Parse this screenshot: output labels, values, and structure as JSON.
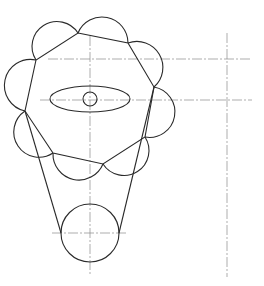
{
  "drawing": {
    "type": "technical-line-drawing",
    "colors": {
      "outline": "#2a2a2a",
      "centerline": "#8a8a8a",
      "background": "#ffffff"
    },
    "polygon_vertices": [
      [
        36,
        60
      ],
      [
        78,
        33
      ],
      [
        128,
        43
      ],
      [
        154,
        87
      ],
      [
        145,
        137
      ],
      [
        103,
        164
      ],
      [
        53,
        153
      ],
      [
        25,
        111
      ]
    ],
    "ellipse": {
      "cx": 90,
      "cy": 99,
      "rx": 40,
      "ry": 13
    },
    "small_circle": {
      "cx": 90,
      "cy": 99,
      "r": 7
    },
    "bottom_circle": {
      "cx": 90,
      "cy": 233,
      "r": 29
    },
    "tangent_lines": [
      [
        [
          25,
          111
        ],
        [
          61,
          233
        ]
      ],
      [
        [
          154,
          87
        ],
        [
          119,
          233
        ]
      ]
    ],
    "centerlines": {
      "vertical_main": {
        "x": 90,
        "y1": 36,
        "y2": 276
      },
      "vertical_right": {
        "x": 227,
        "y1": 33,
        "y2": 277
      },
      "horizontal_upper": {
        "y": 59,
        "x1": 48,
        "x2": 252
      },
      "horizontal_middle": {
        "y": 100,
        "x1": 40,
        "x2": 252
      },
      "horizontal_bottom": {
        "y": 233,
        "x1": 52,
        "x2": 128
      }
    }
  }
}
